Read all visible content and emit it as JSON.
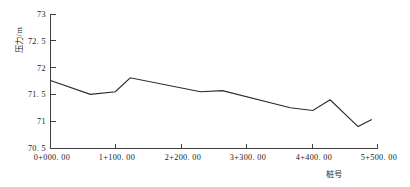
{
  "chart_data": {
    "type": "line",
    "title": "",
    "subtitle": "",
    "xlabel": "桩号",
    "ylabel": "压力/m",
    "xlim": [
      0,
      5.5
    ],
    "ylim": [
      70.5,
      73
    ],
    "grid": false,
    "legend": null,
    "x_tick_labels": [
      "0+000. 00",
      "1+100. 00",
      "2+200. 00",
      "3+300. 00",
      "4+400. 00",
      "5+500. 00"
    ],
    "x_tick_values": [
      0,
      1.1,
      2.2,
      3.3,
      4.4,
      5.5
    ],
    "y_tick_labels": [
      "70. 5",
      "71",
      "71. 5",
      "72",
      "72. 5",
      "73"
    ],
    "y_tick_values": [
      70.5,
      71,
      71.5,
      72,
      72.5,
      73
    ],
    "series": [
      {
        "name": "压力",
        "color": "#2b2b2b",
        "x": [
          0.0,
          0.67,
          1.09,
          1.34,
          2.52,
          2.89,
          4.03,
          4.41,
          4.7,
          5.17,
          5.4
        ],
        "values": [
          71.76,
          71.5,
          71.55,
          71.81,
          71.55,
          71.57,
          71.25,
          71.2,
          71.4,
          70.9,
          71.03
        ]
      }
    ]
  }
}
